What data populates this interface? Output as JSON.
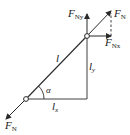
{
  "diagram": {
    "type": "force-decomposition",
    "colors": {
      "stroke": "#2a2a2a",
      "background": "#ffffff"
    },
    "labels": {
      "force_top": {
        "main": "F",
        "sub": "N"
      },
      "force_bottom": {
        "main": "F",
        "sub": "N"
      },
      "force_y": {
        "main": "F",
        "sub": "Ny"
      },
      "force_x": {
        "main": "F",
        "sub": "Nx"
      },
      "length": "l",
      "length_y": {
        "main": "l",
        "sub": "y"
      },
      "length_x": {
        "main": "l",
        "sub": "x"
      },
      "angle": "α"
    }
  }
}
